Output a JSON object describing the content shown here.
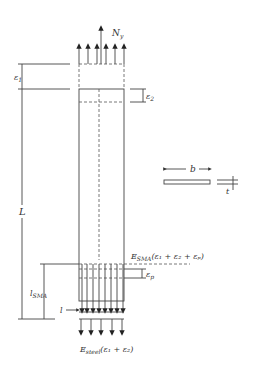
{
  "diagram": {
    "type": "SMA-steel composite member under axial load",
    "labels": {
      "top_force": "N",
      "top_force_sub": "y",
      "eps1": "ε",
      "eps1_sub": "1",
      "eps2": "ε",
      "eps2_sub": "2",
      "length": "L",
      "width": "b",
      "thickness": "t",
      "sma_length": "l",
      "sma_length_sub": "SMA",
      "l_small": "l",
      "epsp": "ε",
      "epsp_sub": "p",
      "sma_stress_prefix": "E",
      "sma_stress_sub": "SMA",
      "sma_stress_expr": "(ε₁ + ε₂ + εₚ)",
      "steel_stress_prefix": "E",
      "steel_stress_sub": "steel",
      "steel_stress_expr": "(ε₁ + ε₂)"
    },
    "colors": {
      "line": "#444444",
      "text": "#333333",
      "background": "#ffffff"
    }
  }
}
